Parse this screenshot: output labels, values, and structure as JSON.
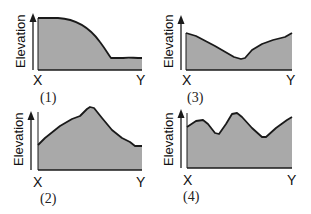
{
  "figure": {
    "axis_label": "Elevation",
    "start_label": "X",
    "end_label": "Y",
    "fill_color": "#a9a9a9",
    "line_color": "#1a1a1a"
  },
  "panels": [
    {
      "id": "1",
      "label": "(1)",
      "description": "High flat plateau near X, convex slope falling steeply, then low flat section to Y",
      "profile_relative": [
        [
          0,
          0.08
        ],
        [
          0.15,
          0.08
        ],
        [
          0.35,
          0.2
        ],
        [
          0.55,
          0.45
        ],
        [
          0.7,
          0.78
        ],
        [
          0.85,
          0.78
        ],
        [
          1,
          0.78
        ]
      ]
    },
    {
      "id": "2",
      "label": "(2)",
      "description": "Low at X rising to a single central peak, then descending to a low flat near Y",
      "profile_relative": [
        [
          0,
          0.55
        ],
        [
          0.25,
          0.2
        ],
        [
          0.42,
          0.05
        ],
        [
          0.5,
          0.05
        ],
        [
          0.75,
          0.5
        ],
        [
          0.9,
          0.6
        ],
        [
          1,
          0.6
        ]
      ]
    },
    {
      "id": "3",
      "label": "(3)",
      "description": "Moderate at X descending to a valley just past center, then rising to Y",
      "profile_relative": [
        [
          0,
          0.3
        ],
        [
          0.3,
          0.55
        ],
        [
          0.52,
          0.72
        ],
        [
          0.58,
          0.7
        ],
        [
          0.8,
          0.45
        ],
        [
          1,
          0.33
        ]
      ]
    },
    {
      "id": "4",
      "label": "(4)",
      "description": "Undulating: small hill, dip, taller peak, deep valley, rising toward Y",
      "profile_relative": [
        [
          0,
          0.25
        ],
        [
          0.15,
          0.18
        ],
        [
          0.3,
          0.42
        ],
        [
          0.45,
          0.08
        ],
        [
          0.52,
          0.08
        ],
        [
          0.72,
          0.5
        ],
        [
          1,
          0.12
        ]
      ]
    }
  ]
}
